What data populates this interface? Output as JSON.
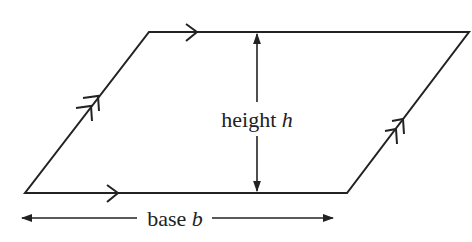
{
  "diagram": {
    "stroke_color": "#222222",
    "background": "#ffffff",
    "shape": {
      "type": "parallelogram",
      "vertices": {
        "top_left": [
          149,
          32
        ],
        "top_right": [
          469,
          32
        ],
        "bottom_right": [
          347,
          193
        ],
        "bottom_left": [
          25,
          193
        ]
      },
      "parallel_marks": {
        "horizontal_sides": "single-arrow",
        "slanted_sides": "double-arrow"
      }
    },
    "labels": {
      "height_word": "height",
      "height_var": "h",
      "base_word": "base",
      "base_var": "b"
    },
    "dimensions": {
      "height": {
        "x": 257,
        "y_top": 32,
        "y_bottom": 193
      },
      "base": {
        "y": 218,
        "x_left": 20,
        "x_right": 335
      }
    }
  }
}
